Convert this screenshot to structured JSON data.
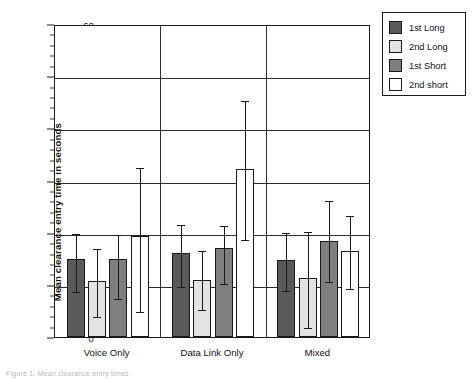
{
  "chart_data": {
    "type": "bar",
    "title": "",
    "xlabel": "",
    "ylabel": "Mean clearance entry time in seconds",
    "ylim": [
      0,
      60
    ],
    "ytick_step": 10,
    "yminor_step": 2,
    "grid": true,
    "legend_position": "right-outside",
    "categories": [
      "Voice Only",
      "Data Link Only",
      "Mixed"
    ],
    "ytick_labels": [
      "0",
      "10",
      "20",
      "30",
      "40",
      "50",
      "60"
    ],
    "series": [
      {
        "name": "1st Long",
        "color": "#595959",
        "values": [
          15.0,
          16.2,
          14.8
        ],
        "err_upper": [
          20.2,
          21.8,
          20.4
        ],
        "err_lower": [
          9.0,
          10.0,
          9.2
        ]
      },
      {
        "name": "2nd Long",
        "color": "#e3e3e3",
        "values": [
          10.8,
          11.0,
          11.4
        ],
        "err_upper": [
          17.3,
          16.8,
          20.6
        ],
        "err_lower": [
          4.3,
          5.6,
          2.2
        ]
      },
      {
        "name": "1st Short",
        "color": "#7f7f7f",
        "values": [
          15.0,
          17.0,
          18.5
        ],
        "err_upper": [
          20.0,
          21.6,
          26.4
        ],
        "err_lower": [
          7.6,
          10.6,
          11.0
        ]
      },
      {
        "name": "2nd short",
        "color": "#ffffff",
        "values": [
          19.3,
          32.3,
          16.5
        ],
        "err_upper": [
          32.8,
          45.6,
          23.6
        ],
        "err_lower": [
          5.2,
          18.9,
          9.5
        ]
      }
    ]
  },
  "legend": {
    "items": [
      {
        "label": "1st Long",
        "color": "#595959"
      },
      {
        "label": "2nd Long",
        "color": "#e3e3e3"
      },
      {
        "label": "1st Short",
        "color": "#7f7f7f"
      },
      {
        "label": "2nd short",
        "color": "#ffffff"
      }
    ]
  },
  "yaxis": {
    "title": "Mean clearance entry time in seconds"
  },
  "caption": {
    "text": "Figure 1. Mean clearance entry times"
  }
}
